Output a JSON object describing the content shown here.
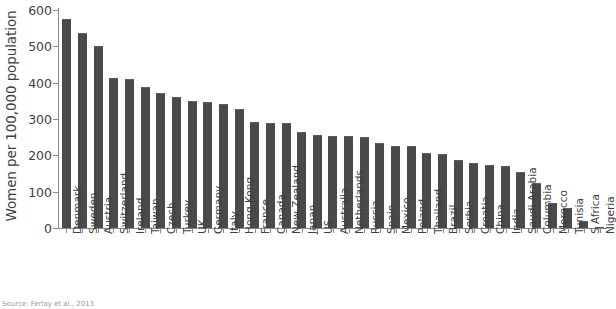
{
  "chart_data": {
    "type": "bar",
    "title": "",
    "xlabel": "",
    "ylabel": "Women per 100,000 population",
    "ylim": [
      0,
      600
    ],
    "yticks": [
      0,
      100,
      200,
      300,
      400,
      500,
      600
    ],
    "grid": false,
    "legend": null,
    "bar_color": "#4a4a4a",
    "axis_color": "#8a8a8a",
    "text_color": "#3f3f3f",
    "categories": [
      "Denmark",
      "Sweden",
      "Austria",
      "Switzerland",
      "Ireland",
      "Taiwan",
      "Czech",
      "Turkey",
      "UK",
      "Germany",
      "Italy",
      "Hong Kong",
      "France",
      "Canada",
      "New Zealand",
      "Japan",
      "US",
      "Australia",
      "Netherlands",
      "Russia",
      "Spain",
      "Mexico",
      "Poland",
      "Thailand",
      "Brazil",
      "Serbia",
      "Croatia",
      "China",
      "India",
      "Saudi Arabia",
      "Columbia",
      "Morocco",
      "Tunisia",
      "S Africa",
      "Nigeria"
    ],
    "values": [
      575,
      538,
      500,
      412,
      410,
      388,
      372,
      360,
      350,
      348,
      340,
      328,
      292,
      290,
      290,
      264,
      256,
      253,
      253,
      250,
      233,
      227,
      226,
      206,
      204,
      187,
      179,
      173,
      170,
      154,
      124,
      69,
      55,
      20,
      3
    ]
  },
  "source_note": "Source: Ferlay et al., 2013"
}
